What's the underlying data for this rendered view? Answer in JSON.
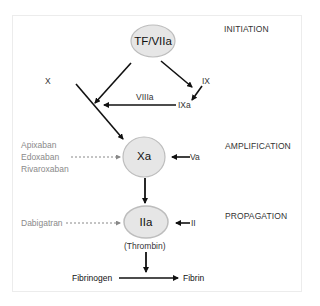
{
  "stages": {
    "initiation": "INITIATION",
    "amplification": "AMPLIFICATION",
    "propagation": "PROPAGATION"
  },
  "nodes": {
    "tf_viia": "TF/VIIa",
    "xa": "Xa",
    "iia": "IIa",
    "iia_caption": "(Thrombin)"
  },
  "factors": {
    "x": "X",
    "ix": "IX",
    "ixa": "IXa",
    "viiia": "VIIIa",
    "va": "Va",
    "ii": "II",
    "fibrinogen": "Fibrinogen",
    "fibrin": "Fibrin"
  },
  "inhibitors": {
    "xa_drugs": [
      "Apixaban",
      "Edoxaban",
      "Rivaroxaban"
    ],
    "iia_drugs": [
      "Dabigatran"
    ]
  },
  "colors": {
    "node_fill": "#e6e6e6",
    "node_stroke": "#bdbdbd",
    "arrow": "#111111",
    "inhibitor_text": "#8a8a8a",
    "inhibitor_arrow": "#888888"
  }
}
